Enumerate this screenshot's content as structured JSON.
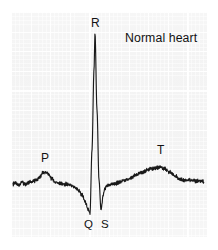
{
  "figure": {
    "title": "Normal heart",
    "caption_labels": [
      "P",
      "Q",
      "R",
      "S",
      "T"
    ],
    "trace_color": "#1a1a1a",
    "paper_color": "#f3f3f3",
    "gridline_color": "#ffffff",
    "background_color": "#ffffff"
  },
  "labels": {
    "p": "P",
    "q": "Q",
    "r": "R",
    "s": "S",
    "t": "T",
    "title": "Normal heart"
  },
  "chart_data": {
    "type": "line",
    "title": "Normal heart",
    "xlabel": "",
    "ylabel": "",
    "grid": true,
    "legend": "none",
    "annotations": [
      {
        "label": "P",
        "x": 44,
        "y": 172,
        "text_x": 44,
        "text_y": 159,
        "meaning": "atrial depolarization"
      },
      {
        "label": "R",
        "x": 95,
        "y": 33,
        "text_x": 95,
        "text_y": 24,
        "meaning": "main ventricular depolarization peak"
      },
      {
        "label": "Q",
        "x": 90,
        "y": 213,
        "text_x": 88,
        "text_y": 225,
        "meaning": "initial downward deflection"
      },
      {
        "label": "S",
        "x": 101,
        "y": 210,
        "text_x": 106,
        "text_y": 225,
        "meaning": "downward deflection after R"
      },
      {
        "label": "T",
        "x": 160,
        "y": 168,
        "text_x": 160,
        "text_y": 150,
        "meaning": "ventricular repolarization"
      },
      {
        "label": "Normal heart",
        "x": 160,
        "y": 39,
        "text_x": 125,
        "text_y": 33,
        "meaning": "figure caption"
      }
    ],
    "axis_ranges": {
      "x": [
        11,
        207
      ],
      "y_pixels": [
        12,
        237
      ]
    },
    "baseline_y": 184,
    "points": [
      [
        13,
        184
      ],
      [
        16,
        183
      ],
      [
        19,
        185
      ],
      [
        22,
        182
      ],
      [
        25,
        184
      ],
      [
        28,
        183
      ],
      [
        31,
        182
      ],
      [
        34,
        181
      ],
      [
        37,
        180
      ],
      [
        40,
        177
      ],
      [
        43,
        173
      ],
      [
        46,
        172
      ],
      [
        49,
        175
      ],
      [
        52,
        179
      ],
      [
        55,
        182
      ],
      [
        58,
        183
      ],
      [
        61,
        183
      ],
      [
        64,
        184
      ],
      [
        67,
        184
      ],
      [
        70,
        185
      ],
      [
        73,
        186
      ],
      [
        76,
        188
      ],
      [
        79,
        191
      ],
      [
        82,
        195
      ],
      [
        85,
        201
      ],
      [
        88,
        209
      ],
      [
        90,
        213
      ],
      [
        92,
        150
      ],
      [
        94,
        70
      ],
      [
        95,
        33
      ],
      [
        97,
        110
      ],
      [
        99,
        180
      ],
      [
        101,
        210
      ],
      [
        103,
        196
      ],
      [
        105,
        188
      ],
      [
        107,
        186
      ],
      [
        110,
        185
      ],
      [
        113,
        184
      ],
      [
        116,
        183
      ],
      [
        120,
        182
      ],
      [
        124,
        180
      ],
      [
        128,
        179
      ],
      [
        132,
        177
      ],
      [
        136,
        175
      ],
      [
        140,
        173
      ],
      [
        145,
        171
      ],
      [
        150,
        169
      ],
      [
        155,
        168
      ],
      [
        160,
        167
      ],
      [
        165,
        169
      ],
      [
        170,
        172
      ],
      [
        175,
        176
      ],
      [
        180,
        179
      ],
      [
        184,
        180
      ],
      [
        188,
        180
      ],
      [
        192,
        180
      ],
      [
        196,
        181
      ],
      [
        200,
        181
      ],
      [
        204,
        182
      ]
    ]
  }
}
